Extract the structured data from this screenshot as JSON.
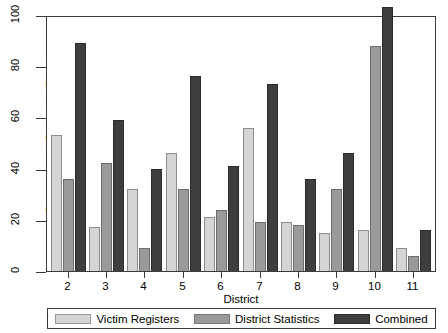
{
  "chart_data": {
    "type": "bar",
    "title": "",
    "xlabel": "District",
    "ylabel": "Frequency of Recorded Deaths",
    "categories": [
      "2",
      "3",
      "4",
      "5",
      "6",
      "7",
      "8",
      "9",
      "10",
      "11"
    ],
    "ylim": [
      0,
      100
    ],
    "yticks": [
      0,
      20,
      40,
      60,
      80,
      100
    ],
    "ytick_labels": [
      "0",
      "20",
      "40",
      "60",
      "80",
      "100"
    ],
    "grid": false,
    "legend_position": "bottom",
    "series": [
      {
        "name": "Victim Registers",
        "color": "#d5d5d5",
        "values": [
          53,
          17,
          32,
          46,
          21,
          56,
          19,
          15,
          16,
          9
        ]
      },
      {
        "name": "District Statistics",
        "color": "#9a9a9a",
        "values": [
          36,
          42,
          9,
          32,
          24,
          19,
          18,
          32,
          88,
          6
        ]
      },
      {
        "name": "Combined",
        "color": "#3e3e3e",
        "values": [
          89,
          59,
          40,
          76,
          41,
          73,
          36,
          46,
          103,
          16
        ]
      }
    ]
  }
}
